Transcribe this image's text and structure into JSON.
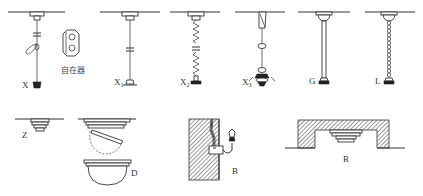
{
  "colors": {
    "line": "#333333",
    "background": "#ffffff",
    "hatch": "#555555"
  },
  "fixtures": [
    {
      "id": "X",
      "label": "X",
      "sub": "",
      "description": "cord pendant with adjuster and lamp"
    },
    {
      "id": "adjuster",
      "label": "自在器",
      "sub": "",
      "description": "cord length adjuster"
    },
    {
      "id": "X1",
      "label": "X",
      "sub": "1",
      "description": "fixed cord pendant"
    },
    {
      "id": "X2",
      "label": "X",
      "sub": "2",
      "description": "spring/coil cord pendant"
    },
    {
      "id": "X3",
      "label": "X",
      "sub": "3",
      "description": "cord pendant with rings and shade"
    },
    {
      "id": "G",
      "label": "G",
      "sub": "",
      "description": "rod (tube) pendant"
    },
    {
      "id": "L",
      "label": "L",
      "sub": "",
      "description": "chain pendant"
    },
    {
      "id": "Z",
      "label": "Z",
      "sub": "",
      "description": "ceiling mounted (surface)"
    },
    {
      "id": "D",
      "label": "D",
      "sub": "",
      "description": "dome ceiling mounted with hinged cover"
    },
    {
      "id": "B",
      "label": "B",
      "sub": "",
      "description": "wall bracket mounted"
    },
    {
      "id": "R",
      "label": "R",
      "sub": "",
      "description": "recessed ceiling mounted"
    }
  ]
}
